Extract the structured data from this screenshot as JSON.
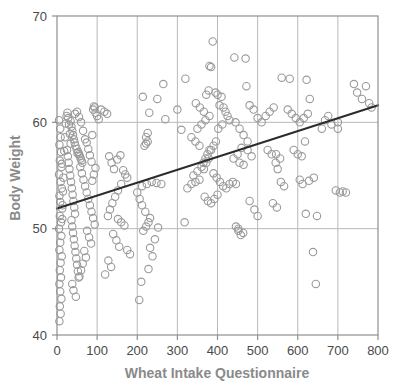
{
  "chart_data": {
    "type": "scatter",
    "title": "",
    "xlabel": "Wheat Intake Questionnaire",
    "ylabel": "Body Weight",
    "xlim": [
      0,
      800
    ],
    "ylim": [
      40,
      70
    ],
    "xticks": [
      0,
      100,
      200,
      300,
      400,
      500,
      600,
      700,
      800
    ],
    "yticks": [
      40,
      50,
      60,
      70
    ],
    "xtick_labels": [
      "0",
      "100",
      "200",
      "300",
      "400",
      "500",
      "600",
      "700",
      "800"
    ],
    "ytick_labels": [
      "40",
      "50",
      "60",
      "70"
    ],
    "grid": true,
    "grid_color": "#b9b9b9",
    "legend": null,
    "marker": "open-circle",
    "marker_edge_color": "#9a9a9a",
    "marker_face_color": "none",
    "marker_size": 5,
    "trendline": {
      "type": "linear",
      "color": "#2b2b2b",
      "width": 2,
      "x_start": 0,
      "y_start": 51.9,
      "x_end": 800,
      "y_end": 61.6
    },
    "series": [
      {
        "name": "Subjects",
        "points": [
          [
            5,
            60.2
          ],
          [
            8,
            59.4
          ],
          [
            9,
            58.6
          ],
          [
            6,
            57.9
          ],
          [
            10,
            57.2
          ],
          [
            7,
            56.4
          ],
          [
            11,
            55.8
          ],
          [
            5,
            55.1
          ],
          [
            9,
            54.4
          ],
          [
            12,
            53.8
          ],
          [
            6,
            53.1
          ],
          [
            8,
            52.5
          ],
          [
            13,
            51.9
          ],
          [
            7,
            51.2
          ],
          [
            10,
            50.6
          ],
          [
            5,
            50.0
          ],
          [
            11,
            49.3
          ],
          [
            8,
            48.7
          ],
          [
            6,
            48.0
          ],
          [
            12,
            47.4
          ],
          [
            9,
            46.8
          ],
          [
            7,
            46.1
          ],
          [
            10,
            45.4
          ],
          [
            6,
            44.8
          ],
          [
            8,
            44.1
          ],
          [
            11,
            43.4
          ],
          [
            7,
            42.7
          ],
          [
            9,
            42.0
          ],
          [
            6,
            41.3
          ],
          [
            13,
            50.9
          ],
          [
            14,
            52.2
          ],
          [
            15,
            53.5
          ],
          [
            16,
            54.8
          ],
          [
            12,
            56.1
          ],
          [
            18,
            57.3
          ],
          [
            20,
            58.6
          ],
          [
            22,
            59.9
          ],
          [
            24,
            60.6
          ],
          [
            26,
            60.9
          ],
          [
            28,
            60.4
          ],
          [
            30,
            59.8
          ],
          [
            32,
            58.9
          ],
          [
            34,
            58.0
          ],
          [
            25,
            57.4
          ],
          [
            27,
            56.8
          ],
          [
            29,
            56.2
          ],
          [
            31,
            55.6
          ],
          [
            33,
            55.0
          ],
          [
            35,
            54.4
          ],
          [
            37,
            53.8
          ],
          [
            39,
            53.2
          ],
          [
            41,
            52.6
          ],
          [
            43,
            52.0
          ],
          [
            45,
            51.4
          ],
          [
            36,
            50.8
          ],
          [
            38,
            50.2
          ],
          [
            40,
            49.6
          ],
          [
            42,
            49.0
          ],
          [
            44,
            48.4
          ],
          [
            46,
            47.8
          ],
          [
            48,
            47.2
          ],
          [
            50,
            46.6
          ],
          [
            52,
            46.0
          ],
          [
            54,
            45.4
          ],
          [
            38,
            44.8
          ],
          [
            41,
            44.2
          ],
          [
            47,
            43.6
          ],
          [
            53,
            57.2
          ],
          [
            55,
            57.0
          ],
          [
            57,
            56.8
          ],
          [
            59,
            56.6
          ],
          [
            61,
            56.4
          ],
          [
            63,
            56.2
          ],
          [
            49,
            57.5
          ],
          [
            51,
            57.1
          ],
          [
            46,
            57.8
          ],
          [
            44,
            58.1
          ],
          [
            42,
            58.4
          ],
          [
            40,
            58.8
          ],
          [
            38,
            59.2
          ],
          [
            36,
            59.6
          ],
          [
            34,
            60.1
          ],
          [
            45,
            60.8
          ],
          [
            50,
            61.0
          ],
          [
            55,
            60.5
          ],
          [
            60,
            60.0
          ],
          [
            65,
            59.2
          ],
          [
            70,
            58.4
          ],
          [
            58,
            55.8
          ],
          [
            62,
            55.2
          ],
          [
            66,
            54.6
          ],
          [
            70,
            54.0
          ],
          [
            74,
            53.4
          ],
          [
            78,
            52.8
          ],
          [
            82,
            52.2
          ],
          [
            86,
            51.6
          ],
          [
            90,
            51.0
          ],
          [
            94,
            50.4
          ],
          [
            75,
            49.8
          ],
          [
            80,
            49.2
          ],
          [
            85,
            48.6
          ],
          [
            68,
            47.9
          ],
          [
            72,
            47.3
          ],
          [
            64,
            46.7
          ],
          [
            60,
            46.1
          ],
          [
            56,
            45.5
          ],
          [
            88,
            54.5
          ],
          [
            92,
            55.1
          ],
          [
            96,
            55.7
          ],
          [
            86,
            56.3
          ],
          [
            82,
            56.9
          ],
          [
            78,
            57.5
          ],
          [
            74,
            58.1
          ],
          [
            88,
            58.8
          ],
          [
            92,
            61.5
          ],
          [
            94,
            61.4
          ],
          [
            90,
            61.2
          ],
          [
            96,
            60.9
          ],
          [
            100,
            60.6
          ],
          [
            104,
            60.3
          ],
          [
            110,
            61.2
          ],
          [
            118,
            61.0
          ],
          [
            125,
            60.8
          ],
          [
            130,
            56.8
          ],
          [
            136,
            56.2
          ],
          [
            142,
            55.6
          ],
          [
            150,
            56.5
          ],
          [
            158,
            56.9
          ],
          [
            165,
            55.5
          ],
          [
            170,
            55.1
          ],
          [
            175,
            54.8
          ],
          [
            160,
            54.2
          ],
          [
            152,
            53.6
          ],
          [
            145,
            53.0
          ],
          [
            138,
            52.4
          ],
          [
            132,
            51.8
          ],
          [
            127,
            51.2
          ],
          [
            152,
            50.9
          ],
          [
            160,
            50.6
          ],
          [
            168,
            50.3
          ],
          [
            140,
            49.5
          ],
          [
            148,
            48.9
          ],
          [
            155,
            48.3
          ],
          [
            175,
            48.0
          ],
          [
            182,
            47.6
          ],
          [
            128,
            47.0
          ],
          [
            135,
            46.4
          ],
          [
            120,
            45.7
          ],
          [
            210,
            45.0
          ],
          [
            205,
            43.3
          ],
          [
            215,
            49.8
          ],
          [
            222,
            50.2
          ],
          [
            228,
            50.6
          ],
          [
            232,
            51.0
          ],
          [
            220,
            51.6
          ],
          [
            212,
            52.2
          ],
          [
            206,
            52.8
          ],
          [
            200,
            53.4
          ],
          [
            212,
            54.0
          ],
          [
            224,
            54.2
          ],
          [
            236,
            54.4
          ],
          [
            248,
            54.3
          ],
          [
            260,
            54.2
          ],
          [
            218,
            57.8
          ],
          [
            222,
            58.0
          ],
          [
            226,
            58.2
          ],
          [
            222,
            58.6
          ],
          [
            226,
            59.0
          ],
          [
            214,
            62.4
          ],
          [
            230,
            60.9
          ],
          [
            250,
            62.2
          ],
          [
            265,
            63.6
          ],
          [
            270,
            60.3
          ],
          [
            238,
            47.4
          ],
          [
            232,
            48.2
          ],
          [
            244,
            49.0
          ],
          [
            252,
            50.1
          ],
          [
            228,
            46.2
          ],
          [
            300,
            61.2
          ],
          [
            310,
            59.3
          ],
          [
            320,
            64.1
          ],
          [
            318,
            50.6
          ],
          [
            325,
            53.8
          ],
          [
            335,
            54.2
          ],
          [
            345,
            54.4
          ],
          [
            355,
            54.6
          ],
          [
            340,
            55.0
          ],
          [
            350,
            55.4
          ],
          [
            360,
            55.8
          ],
          [
            365,
            56.2
          ],
          [
            370,
            56.6
          ],
          [
            375,
            57.0
          ],
          [
            380,
            57.4
          ],
          [
            355,
            57.8
          ],
          [
            345,
            58.2
          ],
          [
            335,
            58.6
          ],
          [
            350,
            59.4
          ],
          [
            360,
            59.8
          ],
          [
            370,
            60.2
          ],
          [
            380,
            60.6
          ],
          [
            366,
            61.0
          ],
          [
            356,
            61.4
          ],
          [
            346,
            61.8
          ],
          [
            372,
            62.6
          ],
          [
            378,
            63.0
          ],
          [
            384,
            65.2
          ],
          [
            380,
            65.3
          ],
          [
            388,
            67.6
          ],
          [
            395,
            62.8
          ],
          [
            400,
            62.6
          ],
          [
            410,
            62.4
          ],
          [
            405,
            61.6
          ],
          [
            415,
            61.4
          ],
          [
            420,
            61.0
          ],
          [
            425,
            60.6
          ],
          [
            430,
            60.2
          ],
          [
            412,
            59.8
          ],
          [
            402,
            59.4
          ],
          [
            396,
            58.2
          ],
          [
            390,
            57.8
          ],
          [
            384,
            57.4
          ],
          [
            378,
            56.6
          ],
          [
            372,
            56.2
          ],
          [
            366,
            55.6
          ],
          [
            390,
            55.2
          ],
          [
            398,
            54.8
          ],
          [
            406,
            54.4
          ],
          [
            414,
            54.0
          ],
          [
            422,
            53.8
          ],
          [
            430,
            54.2
          ],
          [
            438,
            54.4
          ],
          [
            446,
            54.2
          ],
          [
            400,
            53.2
          ],
          [
            392,
            52.8
          ],
          [
            384,
            52.4
          ],
          [
            376,
            52.6
          ],
          [
            368,
            53.0
          ],
          [
            442,
            66.1
          ],
          [
            470,
            66.0
          ],
          [
            445,
            60.0
          ],
          [
            455,
            59.4
          ],
          [
            465,
            58.8
          ],
          [
            475,
            58.2
          ],
          [
            460,
            57.6
          ],
          [
            450,
            57.0
          ],
          [
            440,
            56.6
          ],
          [
            455,
            56.2
          ],
          [
            465,
            56.0
          ],
          [
            475,
            57.4
          ],
          [
            485,
            56.8
          ],
          [
            452,
            49.8
          ],
          [
            458,
            49.4
          ],
          [
            464,
            49.6
          ],
          [
            452,
            50.0
          ],
          [
            446,
            50.2
          ],
          [
            480,
            52.6
          ],
          [
            492,
            51.8
          ],
          [
            500,
            51.2
          ],
          [
            472,
            63.4
          ],
          [
            480,
            61.6
          ],
          [
            490,
            61.2
          ],
          [
            500,
            60.4
          ],
          [
            510,
            60.0
          ],
          [
            520,
            60.6
          ],
          [
            530,
            61.0
          ],
          [
            540,
            61.4
          ],
          [
            525,
            57.4
          ],
          [
            535,
            57.0
          ],
          [
            545,
            56.2
          ],
          [
            550,
            55.6
          ],
          [
            538,
            52.4
          ],
          [
            548,
            52.0
          ],
          [
            558,
            54.4
          ],
          [
            566,
            54.0
          ],
          [
            556,
            56.6
          ],
          [
            546,
            57.0
          ],
          [
            560,
            64.2
          ],
          [
            580,
            64.1
          ],
          [
            575,
            61.2
          ],
          [
            585,
            60.8
          ],
          [
            595,
            60.4
          ],
          [
            605,
            60.0
          ],
          [
            615,
            60.4
          ],
          [
            625,
            60.8
          ],
          [
            590,
            57.4
          ],
          [
            600,
            57.0
          ],
          [
            610,
            56.8
          ],
          [
            618,
            58.2
          ],
          [
            605,
            54.6
          ],
          [
            612,
            54.2
          ],
          [
            620,
            51.4
          ],
          [
            628,
            54.5
          ],
          [
            640,
            54.8
          ],
          [
            622,
            64.0
          ],
          [
            630,
            62.2
          ],
          [
            638,
            47.8
          ],
          [
            645,
            44.8
          ],
          [
            648,
            51.2
          ],
          [
            660,
            59.4
          ],
          [
            668,
            60.2
          ],
          [
            676,
            60.6
          ],
          [
            684,
            59.8
          ],
          [
            700,
            59.4
          ],
          [
            695,
            53.6
          ],
          [
            705,
            53.4
          ],
          [
            712,
            53.5
          ],
          [
            720,
            53.4
          ],
          [
            700,
            60.0
          ],
          [
            740,
            63.6
          ],
          [
            748,
            62.8
          ],
          [
            760,
            62.2
          ],
          [
            770,
            63.4
          ],
          [
            778,
            61.8
          ],
          [
            784,
            61.4
          ]
        ]
      }
    ]
  },
  "axes": {
    "y_title": "Body Weight",
    "x_title": "Wheat Intake Questionnaire"
  }
}
